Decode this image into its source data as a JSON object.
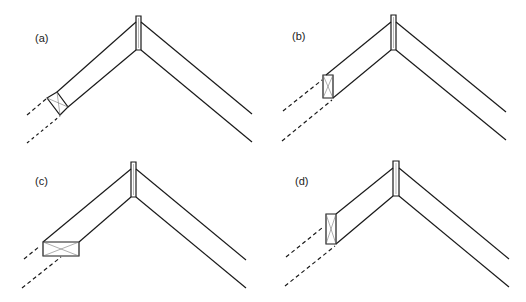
{
  "figure": {
    "stroke_color": "#1a1a1a",
    "panels": [
      {
        "id": "a",
        "label": "(a)",
        "label_pos": [
          35,
          32
        ],
        "box_position": "perpendicular-to-duct",
        "description": "small box perpendicular to lower-left duct"
      },
      {
        "id": "b",
        "label": "(b)",
        "label_pos": [
          292,
          30
        ],
        "box_position": "vertical-at-duct-end",
        "description": "vertical box at lower-left duct end"
      },
      {
        "id": "c",
        "label": "(c)",
        "label_pos": [
          35,
          175
        ],
        "box_position": "horizontal-at-duct-end",
        "description": "horizontal box at lower-left duct end"
      },
      {
        "id": "d",
        "label": "(d)",
        "label_pos": [
          295,
          175
        ],
        "box_position": "tall-vertical-at-duct-end",
        "description": "tall vertical box at lower-left duct end"
      }
    ]
  }
}
